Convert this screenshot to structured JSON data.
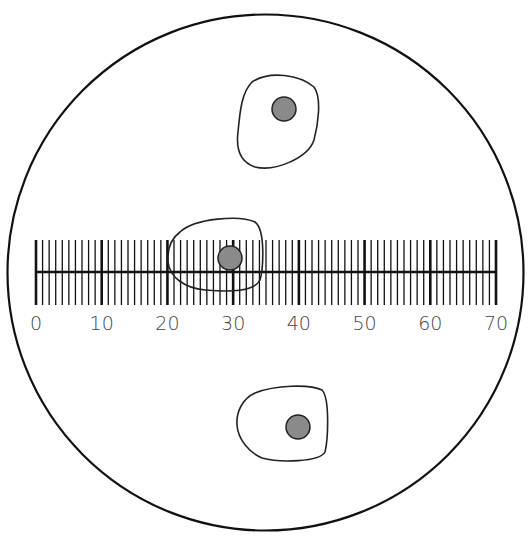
{
  "figure": {
    "type": "microscope field of view with ocular micrometer",
    "field_circle": {
      "cx": 265.5,
      "cy": 272.5,
      "r": 258,
      "stroke": "#111111"
    },
    "scale": {
      "min": 0,
      "max": 70,
      "minor_step": 1,
      "major_step": 10,
      "x_start": 36,
      "x_end": 496,
      "baseline_y": 272,
      "tick_top": 240,
      "tick_bottom": 305,
      "label_y": 330,
      "labels": [
        "0",
        "10",
        "20",
        "30",
        "40",
        "50",
        "60",
        "70"
      ],
      "color": "#111111"
    },
    "cells": [
      {
        "name": "cell-top",
        "outline": "M252,82 C270,70 300,75 314,87 C322,98 318,125 314,140 C308,158 275,172 255,167 C240,162 236,148 238,132 C240,110 242,92 252,82 Z",
        "nucleus": {
          "cx": 284,
          "cy": 109,
          "r": 12
        }
      },
      {
        "name": "cell-middle",
        "outline": "M180,232 C195,218 240,215 255,222 C266,230 263,270 260,280 C254,292 230,292 205,290 C185,288 170,278 168,262 C167,248 172,238 180,232 Z",
        "nucleus": {
          "cx": 230,
          "cy": 258,
          "r": 12
        }
      },
      {
        "name": "cell-bottom",
        "outline": "M255,393 C275,385 310,384 322,390 C330,398 328,440 325,452 C320,462 280,463 262,458 C250,453 238,440 237,425 C236,410 244,398 255,393 Z",
        "nucleus": {
          "cx": 298,
          "cy": 427,
          "r": 12
        }
      }
    ],
    "nucleus_fill": "#8a8a8a",
    "outline_color": "#222222",
    "cropped_header_text": "(text cut off at top edge; not legible)"
  }
}
